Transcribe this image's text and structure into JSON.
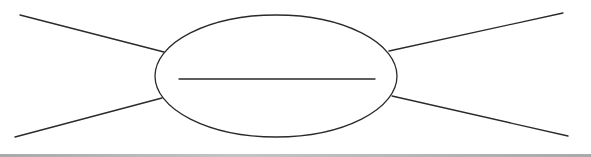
{
  "diagram": {
    "type": "spider-map-organizer",
    "stroke_color": "#2a2a2a",
    "stroke_width": 1.3,
    "center_ellipse": {
      "cx": 276,
      "cy": 76,
      "rx": 121,
      "ry": 61
    },
    "center_write_line": {
      "x1": 179,
      "y1": 79,
      "x2": 375,
      "y2": 79
    },
    "spokes": [
      {
        "name": "spoke-upper-left",
        "x1": 20,
        "y1": 15,
        "x2": 164,
        "y2": 52
      },
      {
        "name": "spoke-lower-left",
        "x1": 15,
        "y1": 137,
        "x2": 162,
        "y2": 98
      },
      {
        "name": "spoke-upper-right",
        "x1": 389,
        "y1": 51,
        "x2": 563,
        "y2": 13
      },
      {
        "name": "spoke-lower-right",
        "x1": 392,
        "y1": 96,
        "x2": 568,
        "y2": 136
      }
    ],
    "bottom_bar_color": "#a9a9a9"
  }
}
